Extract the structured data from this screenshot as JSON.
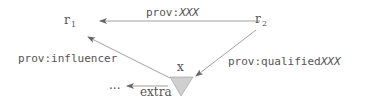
{
  "diagram": {
    "nodes": {
      "r1": {
        "label": "r",
        "subscript": "1"
      },
      "r2": {
        "label": "r",
        "subscript": "2"
      },
      "x": {
        "label": "x",
        "shape": "inverted-triangle",
        "fill": "#cfcfcf"
      },
      "ellipsis": {
        "label": "..."
      }
    },
    "edges": {
      "r2_to_r1": {
        "prefix": "prov:",
        "name": "XXX",
        "from": "r2",
        "to": "r1"
      },
      "x_to_r1": {
        "label": "prov:influencer",
        "from": "x",
        "to": "r1"
      },
      "r2_to_x": {
        "prefix": "prov:qualified",
        "name": "XXX",
        "from": "r2",
        "to": "x"
      },
      "x_to_extra": {
        "label": "extra",
        "from": "x",
        "to": "ellipsis"
      }
    },
    "colors": {
      "line": "#888888",
      "text": "#555555",
      "triangle": "#cfcfcf"
    }
  }
}
